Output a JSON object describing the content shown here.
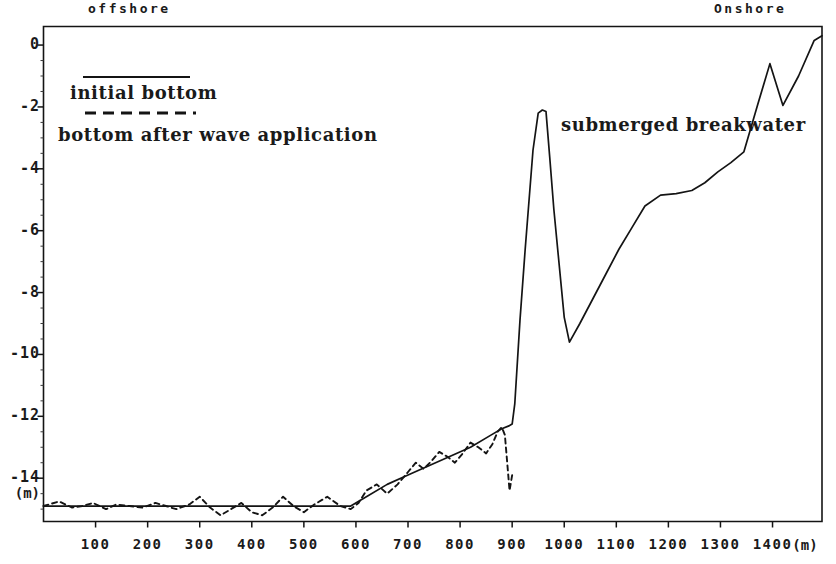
{
  "figure": {
    "region_offshore": "offshore",
    "region_onshore": "Onshore",
    "annotation_breakwater": "submerged breakwater",
    "y_unit": "(m)",
    "x_unit": "(m)",
    "line_color": "#141414"
  },
  "legend": {
    "items": [
      {
        "label": "initial bottom",
        "style": "solid"
      },
      {
        "label": "bottom  after  wave  application",
        "style": "dashed"
      }
    ],
    "solid_label": "initial bottom",
    "dashed_label": "bottom  after  wave  application"
  },
  "chart_data": {
    "type": "line",
    "title": "",
    "subtitle": "",
    "xlabel": "(m)",
    "ylabel": "(m)",
    "xlim": [
      0,
      1495
    ],
    "ylim": [
      -15.4,
      0.6
    ],
    "grid": false,
    "legend_position": "upper-left",
    "annotations": [
      {
        "text": "offshore",
        "x": 125,
        "y": 0.6
      },
      {
        "text": "Onshore",
        "x": 1330,
        "y": 0.6
      },
      {
        "text": "submerged breakwater",
        "x": 1040,
        "y": -3.1
      }
    ],
    "xticks": [
      100,
      200,
      300,
      400,
      500,
      600,
      700,
      800,
      900,
      1000,
      1100,
      1200,
      1300,
      1400
    ],
    "yticks": [
      0,
      -2,
      -4,
      -6,
      -8,
      -10,
      -12,
      -14
    ],
    "yticklabels": [
      "0",
      "-2",
      "-4",
      "-6",
      "-8",
      "-10",
      "-12",
      "-14"
    ],
    "series": [
      {
        "name": "initial bottom",
        "style": "solid",
        "x": [
          0,
          60,
          120,
          180,
          240,
          300,
          360,
          420,
          480,
          540,
          590,
          620,
          660,
          700,
          740,
          780,
          820,
          860,
          880,
          895,
          900,
          905,
          915,
          925,
          940,
          950,
          958,
          965,
          972,
          980,
          1000,
          1010,
          1030,
          1055,
          1080,
          1105,
          1130,
          1155,
          1185,
          1215,
          1245,
          1270,
          1295,
          1320,
          1345,
          1372,
          1395,
          1420,
          1450,
          1480,
          1495
        ],
        "y": [
          -14.9,
          -14.9,
          -14.9,
          -14.9,
          -14.9,
          -14.9,
          -14.9,
          -14.9,
          -14.9,
          -14.9,
          -14.9,
          -14.6,
          -14.2,
          -13.9,
          -13.6,
          -13.3,
          -13.0,
          -12.6,
          -12.4,
          -12.3,
          -12.25,
          -11.6,
          -8.9,
          -6.6,
          -3.4,
          -2.2,
          -2.1,
          -2.15,
          -3.6,
          -5.3,
          -8.8,
          -9.6,
          -9.0,
          -8.2,
          -7.4,
          -6.6,
          -5.9,
          -5.2,
          -4.85,
          -4.8,
          -4.7,
          -4.45,
          -4.1,
          -3.8,
          -3.45,
          -1.9,
          -0.6,
          -1.95,
          -1.0,
          0.15,
          0.3
        ]
      },
      {
        "name": "bottom after wave application",
        "style": "dashed",
        "x": [
          0,
          30,
          55,
          75,
          95,
          120,
          140,
          165,
          190,
          215,
          235,
          255,
          280,
          300,
          320,
          340,
          360,
          380,
          400,
          420,
          440,
          460,
          480,
          500,
          520,
          545,
          570,
          590,
          605,
          620,
          640,
          660,
          680,
          700,
          715,
          730,
          745,
          760,
          775,
          790,
          805,
          820,
          835,
          850,
          862,
          872,
          880,
          886,
          890,
          895,
          900
        ],
        "y": [
          -14.9,
          -14.75,
          -14.95,
          -14.9,
          -14.8,
          -15.0,
          -14.85,
          -14.9,
          -14.95,
          -14.8,
          -14.9,
          -15.0,
          -14.85,
          -14.6,
          -14.95,
          -15.2,
          -15.0,
          -14.8,
          -15.1,
          -15.2,
          -14.95,
          -14.6,
          -14.9,
          -15.1,
          -14.85,
          -14.6,
          -14.9,
          -15.0,
          -14.8,
          -14.4,
          -14.2,
          -14.5,
          -14.2,
          -13.8,
          -13.5,
          -13.7,
          -13.45,
          -13.15,
          -13.3,
          -13.5,
          -13.2,
          -12.85,
          -13.0,
          -13.2,
          -12.9,
          -12.5,
          -12.35,
          -12.6,
          -13.4,
          -14.4,
          -13.9
        ]
      }
    ]
  }
}
